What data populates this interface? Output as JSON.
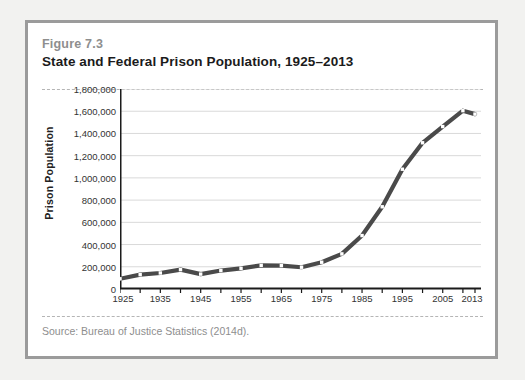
{
  "figure": {
    "number_label": "Figure 7.3",
    "title": "State and Federal Prison Population, 1925–2013",
    "source": "Source: Bureau of Justice Statistics (2014d)."
  },
  "colors": {
    "card_border": "#9b9b9b",
    "page_background": "#f2f2f0",
    "card_background": "#ffffff",
    "line": "#4a4a4a",
    "marker_fill": "#ffffff",
    "gridline": "#d9d9d9",
    "axis": "#1b1b1b",
    "dashed_rule": "#b5b5b5",
    "muted_text": "#8e8e8e"
  },
  "chart_data": {
    "type": "line",
    "title": "State and Federal Prison Population, 1925–2013",
    "xlabel": "",
    "ylabel": "Prison Population",
    "xlim": [
      1925,
      2013
    ],
    "ylim": [
      0,
      1800000
    ],
    "ytick_step": 200000,
    "xtick_step": 5,
    "grid": true,
    "legend": false,
    "ytick_labels": [
      "1,800,000",
      "1,600,000",
      "1,400,000",
      "1,200,000",
      "1,000,000",
      "800,000",
      "600,000",
      "400,000",
      "200,000",
      "0"
    ],
    "ytick_values": [
      1800000,
      1600000,
      1400000,
      1200000,
      1000000,
      800000,
      600000,
      400000,
      200000,
      0
    ],
    "xtick_labels": [
      "1925",
      "1935",
      "1945",
      "1955",
      "1965",
      "1975",
      "1985",
      "1995",
      "2005",
      "2013"
    ],
    "xtick_values": [
      1925,
      1935,
      1945,
      1955,
      1965,
      1975,
      1985,
      1995,
      2005,
      2013
    ],
    "minor_xticks": [
      1930,
      1940,
      1950,
      1960,
      1970,
      1980,
      1990,
      2000,
      2010
    ],
    "series": [
      {
        "name": "State and Federal Prison Population",
        "x": [
          1925,
          1930,
          1935,
          1940,
          1945,
          1950,
          1955,
          1960,
          1965,
          1970,
          1975,
          1980,
          1985,
          1990,
          1995,
          2000,
          2005,
          2010,
          2013
        ],
        "values": [
          92000,
          129000,
          144000,
          174000,
          134000,
          166000,
          186000,
          213000,
          211000,
          196000,
          241000,
          316000,
          481000,
          740000,
          1078000,
          1316000,
          1462000,
          1605000,
          1574000
        ]
      }
    ]
  }
}
